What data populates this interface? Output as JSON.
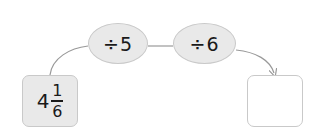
{
  "diagram": {
    "start": {
      "whole": "4",
      "numerator": "1",
      "denominator": "6"
    },
    "operations": [
      {
        "symbol": "÷",
        "operand": "5",
        "label": "÷5"
      },
      {
        "symbol": "÷",
        "operand": "6",
        "label": "÷6"
      }
    ],
    "answer": "",
    "colors": {
      "node_fill": "#e9e9e9",
      "node_border": "#c9c9c9",
      "connector": "#999999",
      "text": "#1a1a1a"
    }
  }
}
